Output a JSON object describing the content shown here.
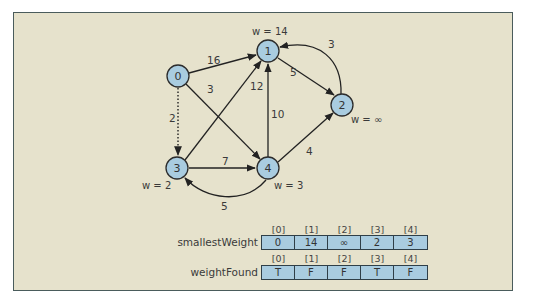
{
  "diagram": {
    "colors": {
      "background": "#e6e2cc",
      "frame_border": "#4a5c5c",
      "node_fill": "#a9cce0",
      "edge": "#222222"
    },
    "nodes": [
      {
        "id": "0",
        "label": "0",
        "x": 178,
        "y": 76,
        "weight_label": ""
      },
      {
        "id": "1",
        "label": "1",
        "x": 268,
        "y": 51,
        "weight_label": "w = 14"
      },
      {
        "id": "2",
        "label": "2",
        "x": 342,
        "y": 105,
        "weight_label": "w = ∞"
      },
      {
        "id": "3",
        "label": "3",
        "x": 177,
        "y": 168,
        "weight_label": "w = 2"
      },
      {
        "id": "4",
        "label": "4",
        "x": 268,
        "y": 168,
        "weight_label": "w = 3"
      }
    ],
    "edges": [
      {
        "from": "0",
        "to": "1",
        "weight": "16",
        "style": "solid"
      },
      {
        "from": "0",
        "to": "4",
        "weight": "3",
        "style": "solid"
      },
      {
        "from": "0",
        "to": "3",
        "weight": "2",
        "style": "dotted"
      },
      {
        "from": "1",
        "to": "2",
        "weight": "5",
        "style": "solid"
      },
      {
        "from": "2",
        "to": "1",
        "weight": "3",
        "style": "curved"
      },
      {
        "from": "3",
        "to": "1",
        "weight": "12",
        "style": "solid"
      },
      {
        "from": "4",
        "to": "1",
        "weight": "10",
        "style": "solid"
      },
      {
        "from": "3",
        "to": "4",
        "weight": "7",
        "style": "solid"
      },
      {
        "from": "4",
        "to": "2",
        "weight": "4",
        "style": "solid"
      },
      {
        "from": "4",
        "to": "3",
        "weight": "5",
        "style": "curved"
      }
    ]
  },
  "arrays": {
    "smallestWeight": {
      "label": "smallestWeight",
      "indices": [
        "[0]",
        "[1]",
        "[2]",
        "[3]",
        "[4]"
      ],
      "values": [
        "0",
        "14",
        "∞",
        "2",
        "3"
      ]
    },
    "weightFound": {
      "label": "weightFound",
      "indices": [
        "[0]",
        "[1]",
        "[2]",
        "[3]",
        "[4]"
      ],
      "values": [
        "T",
        "F",
        "F",
        "T",
        "F"
      ]
    }
  }
}
